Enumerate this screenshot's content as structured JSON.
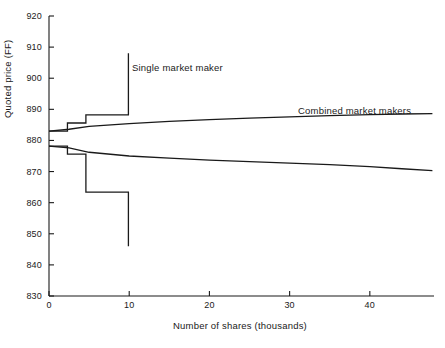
{
  "chart_data": {
    "type": "line",
    "title": "",
    "xlabel": "Number of shares (thousands)",
    "ylabel": "Quoted price (FF)",
    "xlim": [
      0,
      48
    ],
    "ylim": [
      830,
      920
    ],
    "xticks": [
      0,
      10,
      20,
      30,
      40
    ],
    "yticks": [
      830,
      840,
      850,
      860,
      870,
      880,
      890,
      900,
      910,
      920
    ],
    "grid": false,
    "legend_position": "inline-annotation",
    "annotations": [
      {
        "text": "Single market maker",
        "x": 10.1,
        "y": 905
      },
      {
        "text": "Combined market makers",
        "x": 29.5,
        "y": 890
      }
    ],
    "series": [
      {
        "name": "Single market maker ask",
        "style": "step",
        "points": [
          {
            "x": 0.0,
            "y": 883.0
          },
          {
            "x": 2.3,
            "y": 883.0
          },
          {
            "x": 2.3,
            "y": 885.6
          },
          {
            "x": 4.6,
            "y": 885.6
          },
          {
            "x": 4.6,
            "y": 888.2
          },
          {
            "x": 9.9,
            "y": 888.2
          },
          {
            "x": 9.9,
            "y": 908.0
          }
        ]
      },
      {
        "name": "Single market maker bid",
        "style": "step",
        "points": [
          {
            "x": 0.0,
            "y": 878.2
          },
          {
            "x": 2.3,
            "y": 878.2
          },
          {
            "x": 2.3,
            "y": 875.6
          },
          {
            "x": 4.6,
            "y": 875.6
          },
          {
            "x": 4.6,
            "y": 863.4
          },
          {
            "x": 9.9,
            "y": 863.4
          },
          {
            "x": 9.9,
            "y": 846.0
          }
        ]
      },
      {
        "name": "Combined market makers ask",
        "style": "smooth",
        "points": [
          {
            "x": 0.0,
            "y": 883.0
          },
          {
            "x": 2.5,
            "y": 883.6
          },
          {
            "x": 5.0,
            "y": 884.5
          },
          {
            "x": 10.0,
            "y": 885.4
          },
          {
            "x": 15.0,
            "y": 886.1
          },
          {
            "x": 20.0,
            "y": 886.7
          },
          {
            "x": 25.0,
            "y": 887.2
          },
          {
            "x": 30.0,
            "y": 887.6
          },
          {
            "x": 35.0,
            "y": 888.0
          },
          {
            "x": 40.0,
            "y": 888.3
          },
          {
            "x": 44.0,
            "y": 888.5
          },
          {
            "x": 47.8,
            "y": 888.6
          }
        ]
      },
      {
        "name": "Combined market makers bid",
        "style": "smooth",
        "points": [
          {
            "x": 0.0,
            "y": 878.2
          },
          {
            "x": 2.5,
            "y": 877.6
          },
          {
            "x": 5.0,
            "y": 876.2
          },
          {
            "x": 10.0,
            "y": 875.0
          },
          {
            "x": 15.0,
            "y": 874.3
          },
          {
            "x": 20.0,
            "y": 873.7
          },
          {
            "x": 25.0,
            "y": 873.2
          },
          {
            "x": 30.0,
            "y": 872.7
          },
          {
            "x": 35.0,
            "y": 872.2
          },
          {
            "x": 40.0,
            "y": 871.6
          },
          {
            "x": 44.0,
            "y": 870.9
          },
          {
            "x": 47.8,
            "y": 870.3
          }
        ]
      }
    ]
  }
}
